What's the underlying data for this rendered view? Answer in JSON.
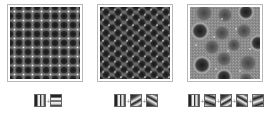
{
  "figure": {
    "panels": [
      {
        "id": "a",
        "pattern": "square-lattice",
        "filters": [
          "vertical-grating",
          "horizontal-grating"
        ],
        "base_color": "#4a4a4a"
      },
      {
        "id": "b",
        "pattern": "hexagonal-lattice",
        "filters": [
          "vertical-grating",
          "diagonal-grating-60",
          "diagonal-grating-120"
        ],
        "base_color": "#5a5a5a"
      },
      {
        "id": "c",
        "pattern": "quasicrystal-lattice",
        "filters": [
          "vertical-grating",
          "diagonal-grating-30",
          "diagonal-grating-60",
          "diagonal-grating-120",
          "diagonal-grating-150"
        ],
        "base_color": "#8a8a8a"
      }
    ],
    "separator": "+",
    "colors": {
      "border": "#b8b8b8",
      "dark_spot": "#1e1e1e",
      "bright_spot": "#f2f2f2",
      "background": "#ffffff"
    }
  }
}
